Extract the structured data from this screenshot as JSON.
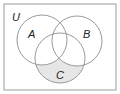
{
  "diagram": {
    "type": "venn",
    "universe_label": "U",
    "sets": [
      {
        "name": "A",
        "label": "A"
      },
      {
        "name": "B",
        "label": "B"
      },
      {
        "name": "C",
        "label": "C"
      }
    ],
    "shaded_region": "C only (C minus A and B)",
    "colors": {
      "outline": "#9a9a9a",
      "shade": "#e6e6e6",
      "background": "#ffffff",
      "text": "#222222"
    }
  }
}
